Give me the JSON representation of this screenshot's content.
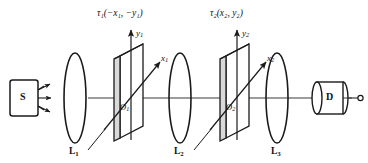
{
  "figure": {
    "background_color": "#ffffff",
    "line_color": "#1a1a1a"
  },
  "source": {
    "label": "S",
    "name": "source-box",
    "ray_count": 3
  },
  "detector": {
    "label": "D",
    "name": "detector-cylinder"
  },
  "lenses": [
    {
      "label": "L",
      "index": "1",
      "cx": 75,
      "cy": 98,
      "rx": 15,
      "ry": 45
    },
    {
      "label": "L",
      "index": "2",
      "cx": 180,
      "cy": 98,
      "rx": 15,
      "ry": 45
    },
    {
      "label": "L",
      "index": "3",
      "cx": 277,
      "cy": 98,
      "rx": 15,
      "ry": 45
    }
  ],
  "planes": [
    {
      "origin_label": "O",
      "origin_index": "1",
      "tau_label": "τ",
      "tau_index": "1",
      "tau_args": "(−x₁, −y₁)",
      "tau_full": "τ₁(−x₁, −y₁)",
      "y_axis_label": "y",
      "y_axis_index": "1",
      "x_axis_label": "x",
      "x_axis_index": "1"
    },
    {
      "origin_label": "O",
      "origin_index": "2",
      "tau_label": "τ",
      "tau_index": "2",
      "tau_args": "(x₂, y₂)",
      "tau_full": "τ₂(x₂, y₂)",
      "y_axis_label": "y",
      "y_axis_index": "2",
      "x_axis_label": "x",
      "x_axis_index": "2"
    }
  ],
  "optical_axis": {
    "y": 98,
    "x_start": 88,
    "x_end": 352
  }
}
